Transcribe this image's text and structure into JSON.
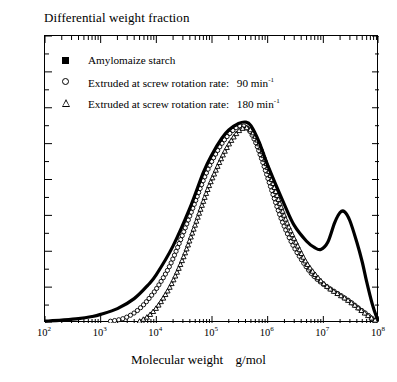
{
  "chart_data": {
    "type": "line",
    "title": "Differential weight fraction",
    "xlabel": "Molecular weight  g/mol",
    "ylabel": "Differential weight fraction",
    "xscale": "log",
    "yscale": "linear",
    "xlim": [
      100,
      100000000
    ],
    "ylim": [
      0.0,
      0.8
    ],
    "grid": false,
    "legend_position": "top-left inside axes",
    "ytick_labels": [
      "0.0",
      "0.1",
      "0.2",
      "0.3",
      "0.4",
      "0.5",
      "0.6",
      "0.7",
      "0.8"
    ],
    "ytick_values": [
      0.0,
      0.1,
      0.2,
      0.3,
      0.4,
      0.5,
      0.6,
      0.7,
      0.8
    ],
    "ytick_minor_step": 0.05,
    "xtick_labels": [
      "10²",
      "10³",
      "10⁴",
      "10⁵",
      "10⁶",
      "10⁷",
      "10⁸"
    ],
    "xtick_values": [
      100,
      1000,
      10000,
      100000,
      1000000,
      10000000,
      100000000
    ],
    "xtick_mantissa": "10",
    "xtick_exponents": [
      "2",
      "3",
      "4",
      "5",
      "6",
      "7",
      "8"
    ],
    "series": [
      {
        "name": "Amylomaize starch",
        "marker": "filled-square",
        "marker_label": "■",
        "color": "#000000",
        "points": [
          [
            100,
            0.005
          ],
          [
            200,
            0.008
          ],
          [
            400,
            0.012
          ],
          [
            700,
            0.018
          ],
          [
            1000,
            0.024
          ],
          [
            2000,
            0.04
          ],
          [
            4000,
            0.068
          ],
          [
            7000,
            0.105
          ],
          [
            10000,
            0.135
          ],
          [
            20000,
            0.215
          ],
          [
            40000,
            0.32
          ],
          [
            70000,
            0.42
          ],
          [
            100000,
            0.47
          ],
          [
            150000,
            0.515
          ],
          [
            200000,
            0.538
          ],
          [
            300000,
            0.556
          ],
          [
            400000,
            0.56
          ],
          [
            500000,
            0.55
          ],
          [
            700000,
            0.505
          ],
          [
            1000000,
            0.44
          ],
          [
            2000000,
            0.33
          ],
          [
            3000000,
            0.272
          ],
          [
            5000000,
            0.228
          ],
          [
            7000000,
            0.21
          ],
          [
            9000000,
            0.205
          ],
          [
            12000000,
            0.225
          ],
          [
            16000000,
            0.28
          ],
          [
            20000000,
            0.308
          ],
          [
            24000000,
            0.31
          ],
          [
            30000000,
            0.285
          ],
          [
            40000000,
            0.225
          ],
          [
            50000000,
            0.17
          ],
          [
            60000000,
            0.115
          ],
          [
            75000000,
            0.055
          ],
          [
            90000000,
            0.018
          ],
          [
            100000000,
            0.008
          ]
        ]
      },
      {
        "name": "Extruded at screw rotation rate:  90 min⁻¹",
        "marker": "open-circle",
        "marker_label": "○",
        "color": "#000000",
        "rate": "90",
        "rate_unit": "min",
        "rate_exponent": "-1",
        "points": [
          [
            1500,
            0.005
          ],
          [
            2500,
            0.012
          ],
          [
            4000,
            0.028
          ],
          [
            6000,
            0.052
          ],
          [
            8000,
            0.075
          ],
          [
            10000,
            0.095
          ],
          [
            15000,
            0.14
          ],
          [
            20000,
            0.18
          ],
          [
            30000,
            0.248
          ],
          [
            50000,
            0.338
          ],
          [
            70000,
            0.398
          ],
          [
            100000,
            0.452
          ],
          [
            150000,
            0.5
          ],
          [
            200000,
            0.525
          ],
          [
            280000,
            0.546
          ],
          [
            350000,
            0.55
          ],
          [
            450000,
            0.54
          ],
          [
            600000,
            0.505
          ],
          [
            800000,
            0.452
          ],
          [
            1000000,
            0.405
          ],
          [
            1500000,
            0.32
          ],
          [
            2000000,
            0.268
          ],
          [
            3000000,
            0.21
          ],
          [
            5000000,
            0.155
          ],
          [
            7000000,
            0.128
          ],
          [
            10000000,
            0.108
          ],
          [
            15000000,
            0.09
          ],
          [
            20000000,
            0.078
          ],
          [
            30000000,
            0.06
          ],
          [
            40000000,
            0.045
          ],
          [
            60000000,
            0.025
          ],
          [
            80000000,
            0.01
          ],
          [
            100000000,
            0.004
          ]
        ]
      },
      {
        "name": "Extruded at screw rotation rate:  180 min⁻¹",
        "marker": "open-triangle",
        "marker_label": "△",
        "color": "#000000",
        "rate": "180",
        "rate_unit": "min",
        "rate_exponent": "-1",
        "points": [
          [
            5000,
            0.005
          ],
          [
            7000,
            0.018
          ],
          [
            10000,
            0.042
          ],
          [
            14000,
            0.075
          ],
          [
            20000,
            0.118
          ],
          [
            30000,
            0.18
          ],
          [
            40000,
            0.232
          ],
          [
            60000,
            0.31
          ],
          [
            80000,
            0.365
          ],
          [
            100000,
            0.402
          ],
          [
            150000,
            0.462
          ],
          [
            200000,
            0.498
          ],
          [
            280000,
            0.53
          ],
          [
            350000,
            0.542
          ],
          [
            430000,
            0.544
          ],
          [
            550000,
            0.53
          ],
          [
            700000,
            0.5
          ],
          [
            900000,
            0.455
          ],
          [
            1200000,
            0.398
          ],
          [
            1600000,
            0.34
          ],
          [
            2200000,
            0.282
          ],
          [
            3000000,
            0.235
          ],
          [
            4500000,
            0.18
          ],
          [
            6000000,
            0.15
          ],
          [
            9000000,
            0.118
          ],
          [
            13000000,
            0.096
          ],
          [
            18000000,
            0.082
          ],
          [
            25000000,
            0.068
          ],
          [
            35000000,
            0.052
          ],
          [
            50000000,
            0.033
          ],
          [
            70000000,
            0.016
          ],
          [
            90000000,
            0.006
          ],
          [
            100000000,
            0.003
          ]
        ]
      }
    ],
    "annotations": {
      "main_peak_value": 0.56,
      "main_peak_position": 350000,
      "secondary_peak_value": 0.31,
      "secondary_peak_position": 20000000,
      "valley_value": 0.205
    }
  },
  "legend": {
    "entries": [
      {
        "label": "Amylomaize starch",
        "marker": "filled-square"
      },
      {
        "label": "Extruded at screw rotation rate:",
        "value": "90",
        "unit": "min",
        "exp": "-1",
        "marker": "open-circle"
      },
      {
        "label": "Extruded at screw rotation rate:",
        "value": "180",
        "unit": "min",
        "exp": "-1",
        "marker": "open-triangle"
      }
    ]
  },
  "axis_title": {
    "top": "Differential weight fraction",
    "bottom_main": "Molecular weight",
    "bottom_unit": "g/mol"
  }
}
